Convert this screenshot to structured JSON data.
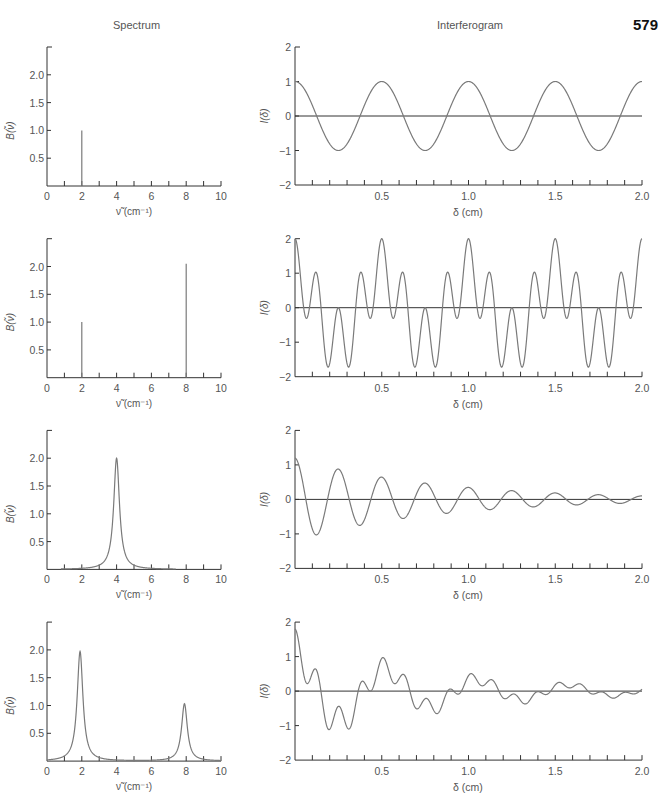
{
  "page": {
    "page_number": "579",
    "column_titles": {
      "spectrum": "Spectrum",
      "interferogram": "Interferogram"
    }
  },
  "style": {
    "axis_color": "#333333",
    "curve_color": "#7a7a7a",
    "text_color": "#555555"
  },
  "chart_data": [
    {
      "panel": "spectrum-1",
      "type": "line",
      "title": "Spectrum",
      "xlabel": "ν̃ (cm⁻¹)",
      "ylabel": "B(ν̃)",
      "xlim": [
        0,
        10
      ],
      "ylim": [
        0,
        2.5
      ],
      "grid": false,
      "xticks": [
        1,
        2,
        3,
        4,
        5,
        6,
        7,
        8,
        9,
        10
      ],
      "xtick_labels": [
        "0",
        "2",
        "4",
        "6",
        "8",
        "10"
      ],
      "yticks": [
        0.5,
        1.0,
        1.5,
        2.0
      ],
      "ytick_labels": [
        "0.5",
        "1.0",
        "1.5",
        "2.0"
      ],
      "lines": [
        {
          "x": 2,
          "height": 1.0
        }
      ]
    },
    {
      "panel": "interferogram-1",
      "type": "line",
      "title": "Interferogram",
      "xlabel": "δ (cm)",
      "ylabel": "I(δ)",
      "xlim": [
        0,
        2.0
      ],
      "ylim": [
        -2,
        2
      ],
      "grid": false,
      "xtick_labels": [
        "0.5",
        "1.0",
        "1.5",
        "2.0"
      ],
      "ytick_labels": [
        "2",
        "1",
        "0",
        "−1",
        "−2"
      ],
      "model": {
        "components": [
          {
            "freq": 2,
            "amp": 1.0
          }
        ],
        "decay": 0
      },
      "x": [
        0,
        0.125,
        0.25,
        0.375,
        0.5,
        0.75,
        1.0,
        1.25,
        1.5,
        1.75,
        2.0
      ],
      "y": [
        1.0,
        0,
        -0.95,
        0,
        1.0,
        -0.95,
        1.0,
        -0.95,
        1.0,
        -1.0,
        1.0
      ]
    },
    {
      "panel": "spectrum-2",
      "type": "line",
      "xlabel": "ν̃ (cm⁻¹)",
      "ylabel": "B(ν̃)",
      "xlim": [
        0,
        10
      ],
      "ylim": [
        0,
        2.5
      ],
      "grid": false,
      "xtick_labels": [
        "0",
        "2",
        "4",
        "6",
        "8",
        "10"
      ],
      "ytick_labels": [
        "0.5",
        "1.0",
        "1.5",
        "2.0"
      ],
      "lines": [
        {
          "x": 2,
          "height": 1.0
        },
        {
          "x": 8,
          "height": 2.05
        }
      ]
    },
    {
      "panel": "interferogram-2",
      "type": "line",
      "xlabel": "δ (cm)",
      "ylabel": "I(δ)",
      "xlim": [
        0,
        2.0
      ],
      "ylim": [
        -2,
        2
      ],
      "grid": false,
      "xtick_labels": [
        "0.5",
        "1.0",
        "1.5",
        "2.0"
      ],
      "ytick_labels": [
        "2",
        "1",
        "0",
        "−1",
        "−2"
      ],
      "model": {
        "components": [
          {
            "freq": 2,
            "amp": 1.0
          },
          {
            "freq": 8,
            "amp": 1.0
          }
        ],
        "decay": 0
      },
      "x": [
        0,
        0.125,
        0.19,
        0.25,
        0.31,
        0.5,
        0.75,
        1.0,
        1.5,
        2.0
      ],
      "y": [
        2.0,
        1.1,
        -1.6,
        0,
        -1.6,
        2.0,
        0,
        2.0,
        2.0,
        1.7
      ]
    },
    {
      "panel": "spectrum-3",
      "type": "line",
      "xlabel": "ν̃ (cm⁻¹)",
      "ylabel": "B(ν̃)",
      "xlim": [
        0,
        10
      ],
      "ylim": [
        0,
        2.5
      ],
      "grid": false,
      "xtick_labels": [
        "0",
        "2",
        "4",
        "6",
        "8",
        "10"
      ],
      "ytick_labels": [
        "0.5",
        "1.0",
        "1.5",
        "2.0"
      ],
      "lorentzians": [
        {
          "center": 4.0,
          "height": 2.0,
          "hwhm": 0.2
        }
      ],
      "range": [
        0.8,
        7.4
      ]
    },
    {
      "panel": "interferogram-3",
      "type": "line",
      "xlabel": "δ (cm)",
      "ylabel": "I(δ)",
      "xlim": [
        0,
        2.0
      ],
      "ylim": [
        -2,
        2
      ],
      "grid": false,
      "xtick_labels": [
        "0.5",
        "1.0",
        "1.5",
        "2.0"
      ],
      "ytick_labels": [
        "2",
        "1",
        "0",
        "−1",
        "−2"
      ],
      "model": {
        "components": [
          {
            "freq": 4,
            "amp": 1.2
          }
        ],
        "decay": 1.24
      },
      "x": [
        0,
        0.125,
        0.25,
        0.375,
        0.5,
        0.625,
        0.75,
        0.875,
        1.0,
        1.25,
        1.5,
        1.75,
        2.0
      ],
      "y": [
        1.2,
        -1.1,
        0.95,
        -0.75,
        0.65,
        -0.5,
        0.5,
        -0.4,
        0.35,
        0.22,
        0.22,
        0.12,
        0.08
      ]
    },
    {
      "panel": "spectrum-4",
      "type": "line",
      "xlabel": "ν̃ (cm⁻¹)",
      "ylabel": "B(ν̃)",
      "xlim": [
        0,
        10
      ],
      "ylim": [
        0,
        2.5
      ],
      "grid": false,
      "xtick_labels": [
        "0",
        "2",
        "4",
        "6",
        "8",
        "10"
      ],
      "ytick_labels": [
        "0.5",
        "1.0",
        "1.5",
        "2.0"
      ],
      "lorentzians": [
        {
          "center": 1.9,
          "height": 1.97,
          "hwhm": 0.2
        },
        {
          "center": 7.9,
          "height": 1.03,
          "hwhm": 0.2
        }
      ],
      "range": [
        0,
        10
      ]
    },
    {
      "panel": "interferogram-4",
      "type": "line",
      "xlabel": "δ (cm)",
      "ylabel": "I(δ)",
      "xlim": [
        0,
        2.0
      ],
      "ylim": [
        -2,
        2
      ],
      "grid": false,
      "xtick_labels": [
        "0.5",
        "1.0",
        "1.5",
        "2.0"
      ],
      "ytick_labels": [
        "2",
        "1",
        "0",
        "−1",
        "−2"
      ],
      "model": {
        "components": [
          {
            "freq": 1.9,
            "amp": 1.2
          },
          {
            "freq": 7.9,
            "amp": 0.6
          }
        ],
        "decay": 1.18
      },
      "x": [
        0,
        0.11,
        0.19,
        0.25,
        0.31,
        0.5,
        0.68,
        1.0,
        1.2,
        1.5,
        2.0
      ],
      "y": [
        1.8,
        0.6,
        -1.2,
        -0.45,
        -1.0,
        1.0,
        -0.6,
        0.55,
        -0.3,
        0.3,
        0.15
      ]
    }
  ]
}
